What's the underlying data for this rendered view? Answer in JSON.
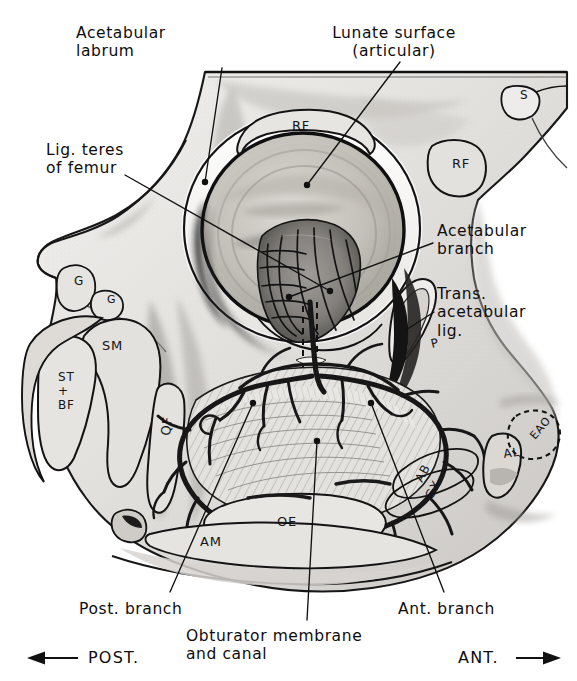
{
  "figure": {
    "background_color": "#ffffff",
    "ink_color": "#111111",
    "bone_fill": "#e9e8e6",
    "bone_shade": "#bfbdb9",
    "bone_dark": "#8d8a86",
    "vessel_color": "#1a1a1a",
    "fossa_dark": "#6f6c68"
  },
  "callouts": [
    {
      "id": "acetabular-labrum",
      "text": "Acetabular\nlabrum",
      "x": 76,
      "y": 24,
      "align": "left",
      "leader": [
        [
          222,
          68
        ],
        [
          205,
          182
        ]
      ]
    },
    {
      "id": "lunate-surface",
      "text": "Lunate surface\n(articular)",
      "x": 394,
      "y": 24,
      "align": "center",
      "leader": [
        [
          400,
          62
        ],
        [
          307,
          185
        ]
      ]
    },
    {
      "id": "lig-teres-of-femur",
      "text": "Lig. teres\nof femur",
      "x": 46,
      "y": 141,
      "align": "left",
      "leader": [
        [
          125,
          175
        ],
        [
          330,
          291
        ]
      ]
    },
    {
      "id": "acetabular-branch",
      "text": "Acetabular\nbranch",
      "x": 437,
      "y": 222,
      "align": "left",
      "leader": [
        [
          433,
          243
        ],
        [
          289,
          297
        ]
      ]
    },
    {
      "id": "trans-acetabular-lig",
      "text": "Trans.\nacetabular\nlig.",
      "x": 437,
      "y": 285,
      "align": "left",
      "leader": [
        [
          434,
          312
        ],
        [
          408,
          330
        ]
      ]
    },
    {
      "id": "post-branch",
      "text": "Post. branch",
      "x": 79,
      "y": 600,
      "align": "left",
      "leader": [
        [
          170,
          592
        ],
        [
          253,
          403
        ]
      ]
    },
    {
      "id": "obturator-membrane-and-canal",
      "text": "Obturator membrane\nand canal",
      "x": 186,
      "y": 627,
      "align": "left",
      "leader": [
        [
          307,
          620
        ],
        [
          317,
          441
        ]
      ]
    },
    {
      "id": "ant-branch",
      "text": "Ant. branch",
      "x": 398,
      "y": 600,
      "align": "left",
      "leader": [
        [
          444,
          592
        ],
        [
          371,
          403
        ]
      ]
    }
  ],
  "orientation": {
    "posterior": {
      "label": "POST.",
      "arrow": "←",
      "x": 28,
      "y": 648
    },
    "anterior": {
      "label": "ANT.",
      "arrow": "→",
      "x": 452,
      "y": 648
    }
  },
  "muscle_marks": [
    {
      "id": "rf-arc",
      "text": "RF",
      "x": 292,
      "y": 130,
      "rotate": 0,
      "size": 13
    },
    {
      "id": "rf-blob",
      "text": "RF",
      "x": 452,
      "y": 168,
      "rotate": 0,
      "size": 13
    },
    {
      "id": "s-blob",
      "text": "S",
      "x": 520,
      "y": 99,
      "rotate": 0,
      "size": 12
    },
    {
      "id": "g-upper",
      "text": "G",
      "x": 74,
      "y": 285,
      "rotate": 0,
      "size": 12
    },
    {
      "id": "g-lower",
      "text": "G",
      "x": 107,
      "y": 303,
      "rotate": 0,
      "size": 11
    },
    {
      "id": "sm",
      "text": "SM",
      "x": 102,
      "y": 350,
      "rotate": 0,
      "size": 13
    },
    {
      "id": "st-bf",
      "text": "ST\n+\nBF",
      "x": 58,
      "y": 381,
      "rotate": 0,
      "size": 12
    },
    {
      "id": "qf",
      "text": "QF",
      "x": 170,
      "y": 436,
      "rotate": -84,
      "size": 13
    },
    {
      "id": "p",
      "text": "P",
      "x": 432,
      "y": 348,
      "rotate": -14,
      "size": 12
    },
    {
      "id": "am",
      "text": "AM",
      "x": 200,
      "y": 546,
      "rotate": 0,
      "size": 13
    },
    {
      "id": "oe",
      "text": "OE",
      "x": 277,
      "y": 526,
      "rotate": 0,
      "size": 13
    },
    {
      "id": "ab",
      "text": "AB",
      "x": 422,
      "y": 483,
      "rotate": -62,
      "size": 12
    },
    {
      "id": "gx",
      "text": "GX",
      "x": 432,
      "y": 500,
      "rotate": -62,
      "size": 12
    },
    {
      "id": "al",
      "text": "AL",
      "x": 504,
      "y": 458,
      "rotate": -8,
      "size": 12
    },
    {
      "id": "eao",
      "text": "EAO",
      "x": 535,
      "y": 440,
      "rotate": -50,
      "size": 11
    }
  ]
}
